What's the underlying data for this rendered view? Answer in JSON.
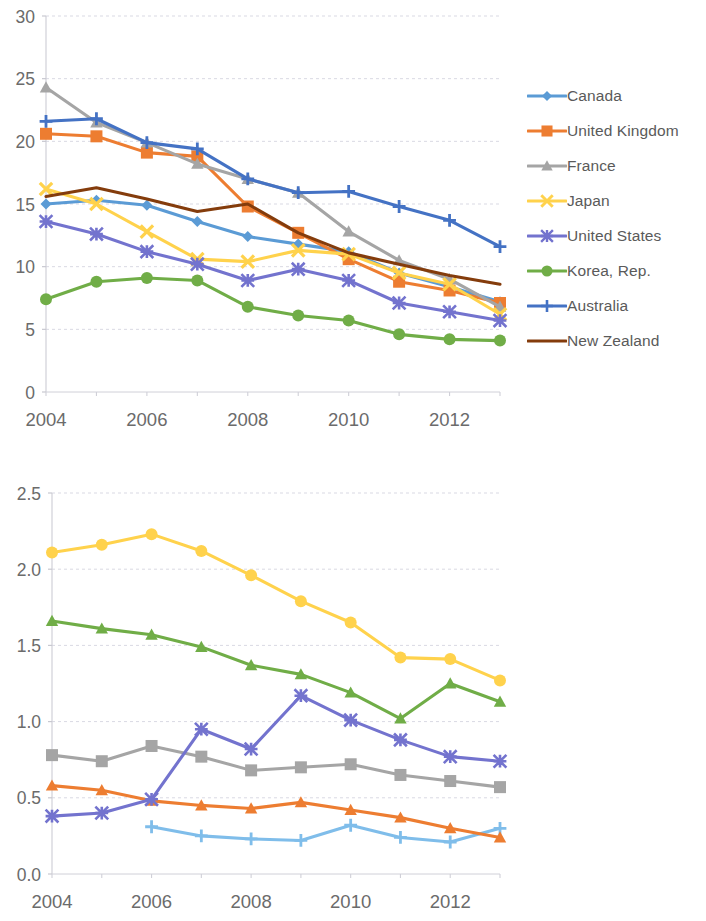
{
  "figure": {
    "charts": [
      {
        "id": "chart-upper",
        "name": "high-income-countries-chart"
      },
      {
        "id": "chart-lower",
        "name": "developing-countries-chart"
      }
    ]
  },
  "chart_data": [
    {
      "type": "line",
      "title": "",
      "subtitle": "",
      "xlabel": "",
      "ylabel": "",
      "x": [
        2004,
        2005,
        2006,
        2007,
        2008,
        2009,
        2010,
        2011,
        2012,
        2013
      ],
      "xtick_labels": [
        "2004",
        "2006",
        "2008",
        "2010",
        "2012"
      ],
      "xticks": [
        2004,
        2006,
        2008,
        2010,
        2012
      ],
      "ytick_labels": [
        "0",
        "5",
        "10",
        "15",
        "20",
        "25",
        "30"
      ],
      "yticks": [
        0,
        5,
        10,
        15,
        20,
        25,
        30
      ],
      "ylim": [
        0,
        30
      ],
      "xlim": [
        2004,
        2013
      ],
      "grid": true,
      "legend_position": "right",
      "series": [
        {
          "name": "Canada",
          "color": "#5B9BD5",
          "marker": "diamond",
          "values": [
            15.0,
            15.3,
            14.9,
            13.6,
            12.4,
            11.8,
            11.2,
            9.5,
            8.4,
            7.2
          ]
        },
        {
          "name": "United Kingdom",
          "color": "#ED7D31",
          "marker": "square",
          "values": [
            20.6,
            20.4,
            19.1,
            18.8,
            14.8,
            12.7,
            10.6,
            8.8,
            8.1,
            7.1
          ]
        },
        {
          "name": "France",
          "color": "#A5A5A5",
          "marker": "triangle",
          "values": [
            24.3,
            21.5,
            19.9,
            18.2,
            17.0,
            15.9,
            12.8,
            10.5,
            9.0,
            6.8
          ]
        },
        {
          "name": "Japan",
          "color": "#FFD24C",
          "marker": "x",
          "values": [
            16.2,
            15.0,
            12.8,
            10.6,
            10.4,
            11.3,
            11.0,
            9.5,
            8.6,
            6.2
          ]
        },
        {
          "name": "United States",
          "color": "#7373CE",
          "marker": "star",
          "values": [
            13.6,
            12.6,
            11.2,
            10.2,
            8.9,
            9.8,
            8.9,
            7.1,
            6.4,
            5.7
          ]
        },
        {
          "name": "Korea, Rep.",
          "color": "#70AD47",
          "marker": "circle",
          "values": [
            7.4,
            8.8,
            9.1,
            8.9,
            6.8,
            6.1,
            5.7,
            4.6,
            4.2,
            4.1
          ]
        },
        {
          "name": "Australia",
          "color": "#4472C4",
          "marker": "plus",
          "values": [
            21.6,
            21.8,
            19.9,
            19.4,
            17.0,
            15.9,
            16.0,
            14.8,
            13.7,
            11.6
          ]
        },
        {
          "name": "New Zealand",
          "color": "#843C0C",
          "marker": "none",
          "values": [
            15.6,
            16.3,
            15.4,
            14.4,
            15.0,
            12.7,
            11.1,
            10.2,
            9.3,
            8.6
          ]
        }
      ]
    },
    {
      "type": "line",
      "title": "",
      "subtitle": "",
      "xlabel": "",
      "ylabel": "",
      "x": [
        2004,
        2005,
        2006,
        2007,
        2008,
        2009,
        2010,
        2011,
        2012,
        2013
      ],
      "xtick_labels": [
        "2004",
        "2006",
        "2008",
        "2010",
        "2012"
      ],
      "xticks": [
        2004,
        2006,
        2008,
        2010,
        2012
      ],
      "ytick_labels": [
        "0.0",
        "0.5",
        "1.0",
        "1.5",
        "2.0",
        "2.5"
      ],
      "yticks": [
        0.0,
        0.5,
        1.0,
        1.5,
        2.0,
        2.5
      ],
      "ylim": [
        0.0,
        2.5
      ],
      "xlim": [
        2004,
        2013
      ],
      "grid": true,
      "legend_position": "right",
      "series": [
        {
          "name": "Bangladesh",
          "color": "#7FBDEA",
          "marker": "plus",
          "values": [
            null,
            null,
            0.31,
            0.25,
            0.23,
            0.22,
            0.32,
            0.24,
            0.21,
            0.3
          ]
        },
        {
          "name": "India",
          "color": "#ED7D31",
          "marker": "triangle",
          "values": [
            0.58,
            0.55,
            0.48,
            0.45,
            0.43,
            0.47,
            0.42,
            0.37,
            0.3,
            0.24
          ]
        },
        {
          "name": "Indonesia",
          "color": "#A5A5A5",
          "marker": "square",
          "values": [
            0.78,
            0.74,
            0.84,
            0.77,
            0.68,
            0.7,
            0.72,
            0.65,
            0.61,
            0.57
          ]
        },
        {
          "name": "Philippines",
          "color": "#FFD24C",
          "marker": "circle",
          "values": [
            2.11,
            2.16,
            2.23,
            2.12,
            1.96,
            1.79,
            1.65,
            1.42,
            1.41,
            1.27
          ]
        },
        {
          "name": "Russian\nFederation",
          "color": "#7373CE",
          "marker": "star",
          "values": [
            0.38,
            0.4,
            0.49,
            0.95,
            0.82,
            1.17,
            1.01,
            0.88,
            0.77,
            0.74
          ]
        },
        {
          "name": "Thailand",
          "color": "#70AD47",
          "marker": "triangle",
          "values": [
            1.66,
            1.61,
            1.57,
            1.49,
            1.37,
            1.31,
            1.19,
            1.02,
            1.25,
            1.13
          ]
        }
      ]
    }
  ]
}
